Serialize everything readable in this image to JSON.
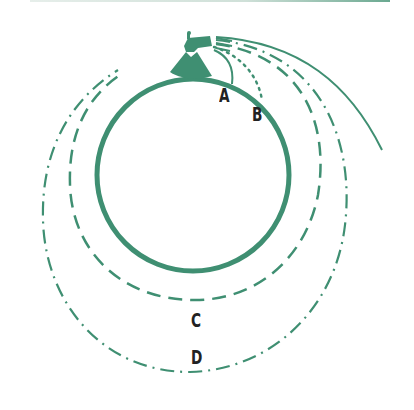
{
  "diagram": {
    "title": "",
    "colors": {
      "accent": "#3f8f72",
      "text": "#222222",
      "background": "#ffffff"
    },
    "planet": {
      "shape": "circle",
      "style": "solid"
    },
    "cannon": {
      "icon": "cannon-on-mountain-icon"
    },
    "trajectories": [
      {
        "id": "A",
        "label": "A",
        "style": "solid-thin",
        "outcome": "falls to ground"
      },
      {
        "id": "B",
        "label": "B",
        "style": "dotted",
        "outcome": "falls to ground"
      },
      {
        "id": "C",
        "label": "C",
        "style": "dashed",
        "outcome": "circular orbit"
      },
      {
        "id": "D",
        "label": "D",
        "style": "dash-dot",
        "outcome": "elliptical orbit"
      },
      {
        "id": "E",
        "label": "",
        "style": "solid",
        "outcome": "escape"
      }
    ]
  }
}
